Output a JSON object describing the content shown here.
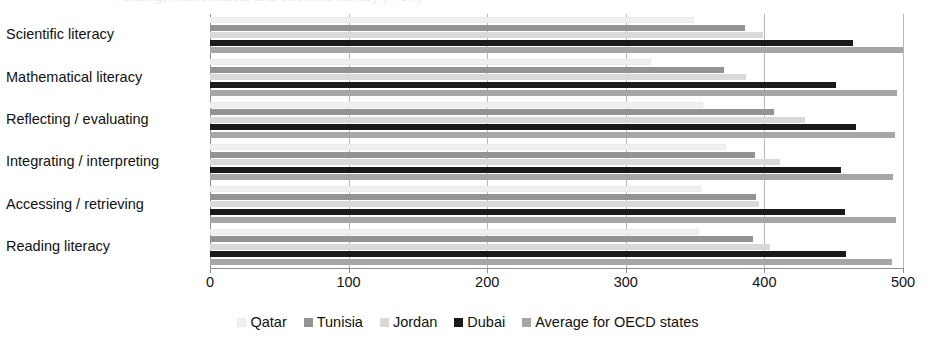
{
  "top_cut_text": "reading, mathematical and scientific literacy (PISA)",
  "chart_data": {
    "type": "bar",
    "orientation": "horizontal",
    "title": "",
    "subtitle": "",
    "xlabel": "",
    "ylabel": "",
    "xlim": [
      0,
      500
    ],
    "xticks": [
      0,
      100,
      200,
      300,
      400,
      500
    ],
    "xtick_labels": [
      "0",
      "100",
      "200",
      "300",
      "400",
      "500"
    ],
    "grid": true,
    "legend_position": "bottom",
    "categories": [
      "Scientific literacy",
      "Mathematical literacy",
      "Reflecting / evaluating",
      "Integrating / interpreting",
      "Accessing / retrieving",
      "Reading literacy"
    ],
    "series": [
      {
        "name": "Qatar",
        "color": "#f0f0f0",
        "values": [
          349,
          318,
          356,
          372,
          354,
          353
        ]
      },
      {
        "name": "Tunisia",
        "color": "#939393",
        "values": [
          386,
          371,
          407,
          393,
          394,
          392
        ]
      },
      {
        "name": "Jordan",
        "color": "#d9d9d9",
        "values": [
          399,
          387,
          429,
          411,
          396,
          404
        ]
      },
      {
        "name": "Dubai",
        "color": "#1a1a1a",
        "values": [
          464,
          452,
          466,
          455,
          458,
          459
        ]
      },
      {
        "name": "Average for OECD states",
        "color": "#a6a6a6",
        "values": [
          500,
          496,
          494,
          493,
          495,
          492
        ]
      }
    ]
  },
  "legend": {
    "items": [
      {
        "label": "Qatar",
        "color": "#f0f0f0"
      },
      {
        "label": "Tunisia",
        "color": "#939393"
      },
      {
        "label": "Jordan",
        "color": "#d9d9d9"
      },
      {
        "label": "Dubai",
        "color": "#1a1a1a"
      },
      {
        "label": "Average for OECD states",
        "color": "#a6a6a6"
      }
    ]
  },
  "colors": {
    "gridline": "#b9b9b9",
    "axis": "#8f8f8f",
    "text": "#111111",
    "background": "#ffffff"
  }
}
